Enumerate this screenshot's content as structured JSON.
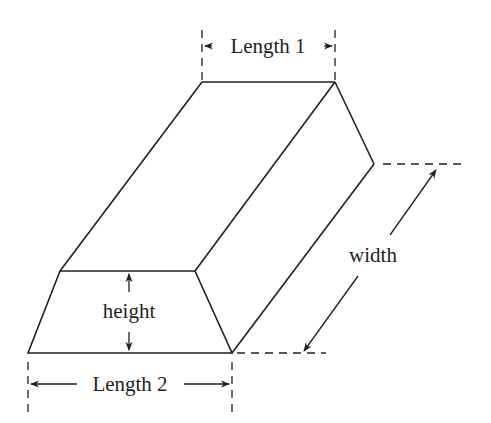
{
  "diagram": {
    "labels": {
      "length1": "Length 1",
      "length2": "Length 2",
      "height": "height",
      "width": "width"
    },
    "colors": {
      "stroke": "#231f20",
      "background": "#ffffff"
    }
  }
}
